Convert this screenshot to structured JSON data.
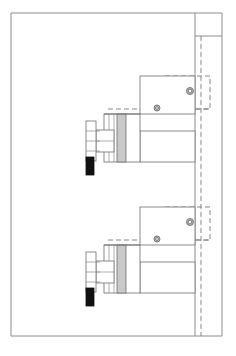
{
  "sheet": {
    "width": 236,
    "height": 356,
    "background": "#ffffff",
    "title": "Mechanical assembly sectional drawing",
    "description": "Two mirrored clamp cylinder assemblies shown in side elevation within a drawing border",
    "line_color": "#6e6e6e",
    "border_color": "#8c8c8c",
    "hidden_line_color": "#7a7a7a"
  },
  "frame": {
    "name": "drawing-border",
    "outer": {
      "x": 11,
      "y": 13,
      "width": 211,
      "height": 323
    },
    "step": {
      "x": 195,
      "y": 13,
      "width": 27,
      "height": 23
    },
    "inner_vertical_x": 195,
    "stroke": "#8c8c8c"
  },
  "colors": {
    "outline": "#6e6e6e",
    "thin_outline": "#8a8a8a",
    "band_gray": "#c9c9c9",
    "indicator_black": "#111111",
    "hole_gray": "#bdbdbd",
    "hole_stroke": "#6e6e6e",
    "body_white": "#ffffff",
    "border": "#8c8c8c"
  },
  "assemblies": [
    {
      "id": "upper-assembly",
      "label": "Upper clamp cylinder assembly",
      "position": "top",
      "handle": {
        "name": "flange-plate",
        "x": 86,
        "y": 121,
        "width": 10,
        "height": 40,
        "tick_count": 3
      },
      "stem": {
        "name": "stem-bracket",
        "x": 96,
        "y": 130,
        "width": 18,
        "height": 22
      },
      "indicator": {
        "name": "black-indicator-bar",
        "x": 86,
        "y": 157,
        "width": 8,
        "height": 18,
        "fill": "#111111"
      },
      "barrel": {
        "name": "cylinder-barrel",
        "x": 104,
        "y": 114,
        "width": 36,
        "height": 48
      },
      "band": {
        "name": "piston-seal-band",
        "x": 117,
        "y": 114,
        "width": 9,
        "height": 48,
        "fill": "#c9c9c9"
      },
      "arm": {
        "name": "horizontal-arm",
        "x": 140,
        "y": 131,
        "width": 55,
        "height": 31
      },
      "body_block": {
        "name": "mounting-block",
        "x": 140,
        "y": 76,
        "width": 55,
        "height": 38
      },
      "hidden_block": {
        "name": "hidden-bore-outline",
        "x": 165,
        "y": 76,
        "width": 45,
        "height": 33
      },
      "holes": [
        {
          "name": "bore-hole-small",
          "cx": 157,
          "cy": 108,
          "r": 3,
          "fill": "#bdbdbd"
        },
        {
          "name": "bore-hole-large",
          "cx": 190,
          "cy": 91,
          "r": 3.5,
          "fill": "#bdbdbd"
        }
      ]
    },
    {
      "id": "lower-assembly",
      "label": "Lower clamp cylinder assembly",
      "position": "bottom",
      "handle": {
        "name": "flange-plate",
        "x": 86,
        "y": 252,
        "width": 10,
        "height": 40,
        "tick_count": 3
      },
      "stem": {
        "name": "stem-bracket",
        "x": 96,
        "y": 261,
        "width": 18,
        "height": 22
      },
      "indicator": {
        "name": "black-indicator-bar",
        "x": 86,
        "y": 288,
        "width": 8,
        "height": 18,
        "fill": "#111111"
      },
      "barrel": {
        "name": "cylinder-barrel",
        "x": 104,
        "y": 245,
        "width": 36,
        "height": 48
      },
      "band": {
        "name": "piston-seal-band",
        "x": 117,
        "y": 245,
        "width": 9,
        "height": 48,
        "fill": "#c9c9c9"
      },
      "arm": {
        "name": "horizontal-arm",
        "x": 140,
        "y": 262,
        "width": 55,
        "height": 31
      },
      "body_block": {
        "name": "mounting-block",
        "x": 140,
        "y": 207,
        "width": 55,
        "height": 38
      },
      "hidden_block": {
        "name": "hidden-bore-outline",
        "x": 165,
        "y": 207,
        "width": 45,
        "height": 33
      },
      "holes": [
        {
          "name": "bore-hole-small",
          "cx": 157,
          "cy": 239,
          "r": 3,
          "fill": "#bdbdbd"
        },
        {
          "name": "bore-hole-large",
          "cx": 190,
          "cy": 222,
          "r": 3.5,
          "fill": "#bdbdbd"
        }
      ]
    }
  ],
  "center_line": {
    "name": "vertical-hidden-centerline",
    "x": 201,
    "y_start": 36,
    "y_end": 336
  }
}
